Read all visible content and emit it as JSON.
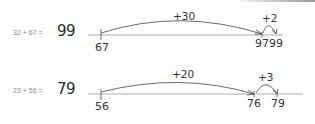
{
  "problems": [
    {
      "equation": "32 + 67 =",
      "answer": "99",
      "start_label": "67",
      "big_jump": "+30",
      "mid_label": "97",
      "small_jump": "+2",
      "end_label": "99"
    },
    {
      "equation": "23 + 56 =",
      "answer": "79",
      "start_label": "56",
      "big_jump": "+20",
      "mid_label": "76",
      "small_jump": "+3",
      "end_label": "79"
    }
  ],
  "colors": {
    "line": "#8f8f8f",
    "ink": "#333333",
    "equation_text": "#8a8a8a"
  }
}
